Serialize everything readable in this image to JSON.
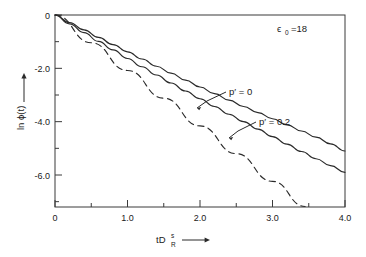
{
  "chart_data": {
    "type": "line",
    "title": "",
    "xlabel": "tD_R^s",
    "ylabel": "ln φ(t)",
    "xlim": [
      0,
      4.0
    ],
    "ylim": [
      -7.2,
      0
    ],
    "grid": false,
    "legend_position": "inline-annotations",
    "x_ticks": [
      "0",
      "1.0",
      "2.0",
      "3.0",
      "4.0"
    ],
    "x_tick_values": [
      0,
      1.0,
      2.0,
      3.0,
      4.0
    ],
    "x_minor_ticks": [
      0.5,
      1.5,
      2.5,
      3.5
    ],
    "y_ticks": [
      "0",
      "-2.0",
      "-4.0",
      "-6.0"
    ],
    "y_tick_values": [
      0,
      -2.0,
      -4.0,
      -6.0
    ],
    "y_minor_ticks": [
      -1.0,
      -3.0,
      -5.0,
      -7.0
    ],
    "annotations": [
      {
        "name": "epsilon-annotation",
        "text": "ϵ",
        "sub": "0",
        "rest": "=18",
        "x": 3.0,
        "y": -0.45
      },
      {
        "name": "p-prime-0-label",
        "text": "p′ = 0",
        "x": 2.48,
        "y": -2.35
      },
      {
        "name": "p-prime-02-label",
        "text": "p′ = 0.2",
        "x": 2.95,
        "y": -3.45
      }
    ],
    "series": [
      {
        "name": "p' = 0",
        "style": "solid",
        "label": "p′ = 0",
        "x": [
          0,
          0.2,
          0.4,
          0.6,
          0.8,
          1.0,
          1.2,
          1.4,
          1.6,
          1.8,
          2.0,
          2.2,
          2.4,
          2.6,
          2.8,
          3.0,
          3.2,
          3.4,
          3.6,
          3.8,
          4.0
        ],
        "y": [
          0,
          -0.28,
          -0.56,
          -0.84,
          -1.11,
          -1.38,
          -1.65,
          -1.92,
          -2.18,
          -2.44,
          -2.7,
          -2.95,
          -3.19,
          -3.43,
          -3.66,
          -3.89,
          -4.12,
          -4.35,
          -4.58,
          -4.83,
          -5.1
        ]
      },
      {
        "name": "p' = 0.2",
        "style": "solid",
        "label": "p′ = 0.2",
        "x": [
          0,
          0.2,
          0.4,
          0.6,
          0.8,
          1.0,
          1.2,
          1.4,
          1.6,
          1.8,
          2.0,
          2.2,
          2.4,
          2.6,
          2.8,
          3.0,
          3.2,
          3.4,
          3.6,
          3.8,
          4.0
        ],
        "y": [
          0,
          -0.33,
          -0.66,
          -0.99,
          -1.31,
          -1.63,
          -1.94,
          -2.25,
          -2.55,
          -2.85,
          -3.14,
          -3.43,
          -3.72,
          -4.0,
          -4.28,
          -4.56,
          -4.84,
          -5.12,
          -5.39,
          -5.65,
          -5.9
        ]
      },
      {
        "name": "asymptote",
        "style": "dashed",
        "label": "",
        "x": [
          0,
          0.5,
          1.0,
          1.5,
          2.0,
          2.5,
          3.0,
          3.45
        ],
        "y": [
          0,
          -1.04,
          -2.08,
          -3.12,
          -4.16,
          -5.2,
          -6.24,
          -7.18
        ]
      }
    ]
  },
  "axes": {
    "y_axis_arrow": "→",
    "x_axis_arrow": "→",
    "y_title_main": "ln ϕ(t)",
    "x_title_base": "tD",
    "x_title_sup": "s",
    "x_title_sub": "R"
  }
}
